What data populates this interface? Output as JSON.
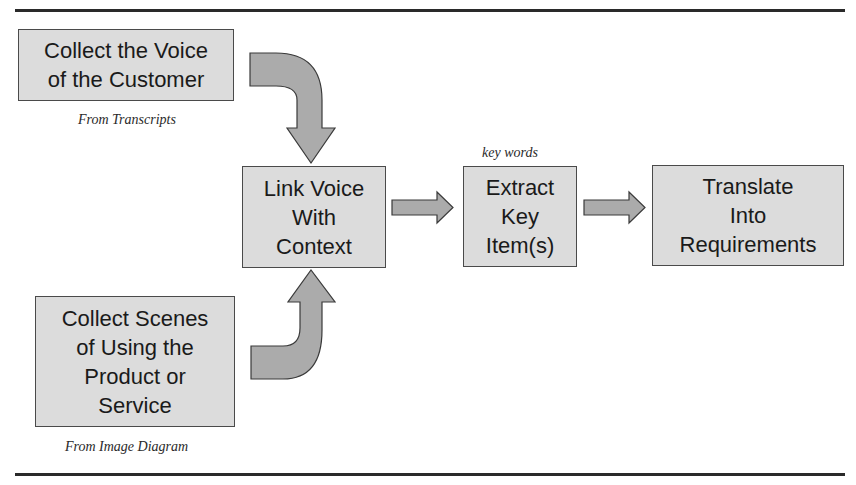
{
  "diagram": {
    "boxes": {
      "voice": "Collect the Voice\nof the Customer",
      "scenes": "Collect Scenes\nof Using the\nProduct or\nService",
      "link": "Link Voice\nWith\nContext",
      "extract": "Extract\nKey\nItem(s)",
      "translate": "Translate\nInto\nRequirements"
    },
    "captions": {
      "voice": "From Transcripts",
      "scenes": "From Image Diagram",
      "extract": "key words"
    },
    "arrows": [
      {
        "from": "voice",
        "to": "link",
        "shape": "curved-down"
      },
      {
        "from": "scenes",
        "to": "link",
        "shape": "curved-up"
      },
      {
        "from": "link",
        "to": "extract",
        "shape": "straight-right"
      },
      {
        "from": "extract",
        "to": "translate",
        "shape": "straight-right"
      }
    ],
    "colors": {
      "box_fill": "#dcdcdc",
      "box_border": "#4a4a4a",
      "arrow_fill": "#ababab",
      "rule": "#2a2a2a"
    }
  }
}
